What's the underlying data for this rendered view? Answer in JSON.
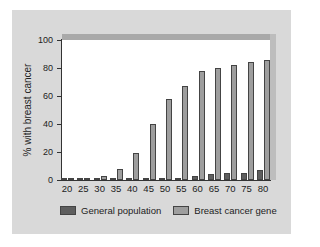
{
  "chart_data": {
    "type": "bar",
    "title": "",
    "xlabel": "",
    "ylabel": "% with breast cancer",
    "ylim": [
      0,
      100
    ],
    "yticks": [
      0,
      20,
      40,
      60,
      80,
      100
    ],
    "grid": false,
    "legend_position": "bottom",
    "categories": [
      "20",
      "25",
      "30",
      "35",
      "40",
      "45",
      "50",
      "55",
      "60",
      "65",
      "70",
      "75",
      "80"
    ],
    "series": [
      {
        "name": "General population",
        "color": "#5e5e5e",
        "values": [
          0,
          0,
          0,
          0.5,
          0.5,
          1,
          1.5,
          1.5,
          3,
          4,
          5,
          5,
          7
        ]
      },
      {
        "name": "Breast cancer gene",
        "color": "#9e9e9e",
        "values": [
          1,
          1.5,
          3,
          8,
          19,
          40,
          58,
          67,
          78,
          80,
          82,
          84,
          86
        ]
      }
    ]
  },
  "axis": {
    "ytitle": "% with breast cancer",
    "yticks": [
      "0",
      "20",
      "40",
      "60",
      "80",
      "100"
    ]
  },
  "legend": {
    "items": [
      {
        "label": "General population",
        "color": "#5e5e5e"
      },
      {
        "label": "Breast cancer gene",
        "color": "#9e9e9e"
      }
    ]
  }
}
